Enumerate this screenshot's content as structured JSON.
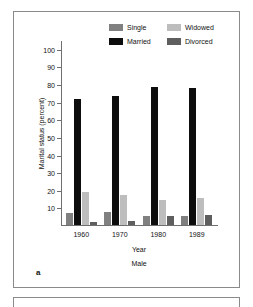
{
  "figure": {
    "panel_letter": "a",
    "subject_label": "Male"
  },
  "chart_data": {
    "type": "bar",
    "title": "",
    "xlabel": "Year",
    "ylabel": "Marital status (percent)",
    "categories": [
      "1960",
      "1970",
      "1980",
      "1989"
    ],
    "ylim": [
      0,
      105
    ],
    "yticks": [
      10,
      20,
      30,
      40,
      50,
      60,
      70,
      80,
      90,
      100
    ],
    "ytick_labels": [
      "10",
      "20",
      "30",
      "40",
      "50",
      "60",
      "70",
      "80",
      "90",
      "100"
    ],
    "grid": false,
    "legend_position": "top-right",
    "series": [
      {
        "name": "Single",
        "color": "#808080",
        "values": [
          7,
          7.5,
          5,
          5
        ]
      },
      {
        "name": "Married",
        "color": "#0d0d0d",
        "values": [
          71.5,
          73,
          78.5,
          77.5
        ]
      },
      {
        "name": "Widowed",
        "color": "#bdbdbd",
        "values": [
          19,
          17,
          14,
          15.5
        ]
      },
      {
        "name": "Divorced",
        "color": "#5e5e5e",
        "values": [
          1.5,
          2.5,
          5,
          5.5
        ]
      }
    ]
  }
}
